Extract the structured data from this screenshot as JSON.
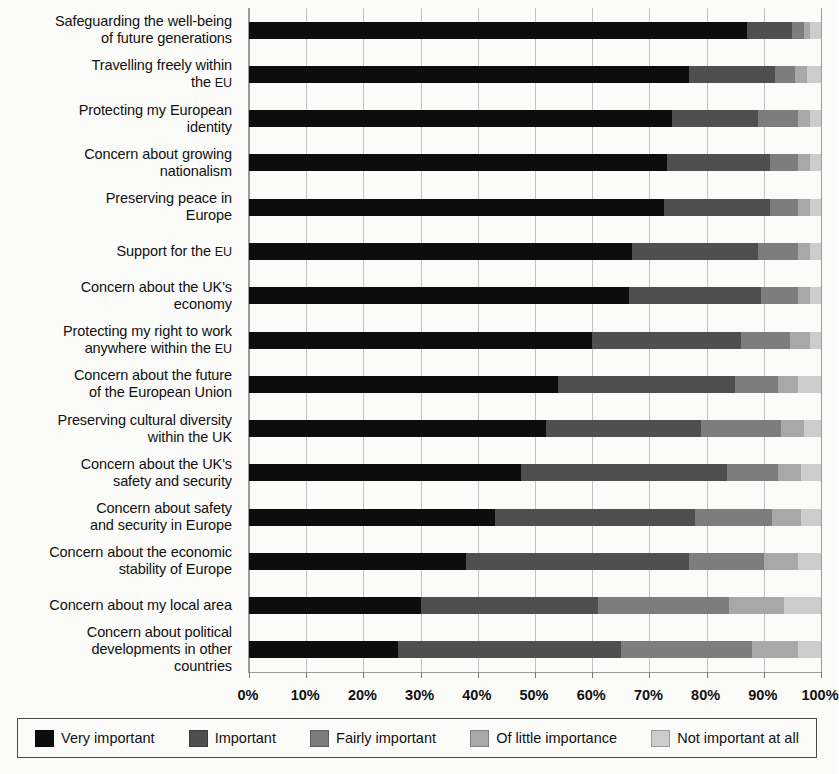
{
  "chart_data": {
    "type": "bar",
    "subtype": "horizontal-stacked-100",
    "title": "",
    "xlabel": "",
    "ylabel": "",
    "xlim": [
      0,
      100
    ],
    "xticks": [
      "0%",
      "10%",
      "20%",
      "30%",
      "40%",
      "50%",
      "60%",
      "70%",
      "80%",
      "90%",
      "100%"
    ],
    "xtick_values": [
      0,
      10,
      20,
      30,
      40,
      50,
      60,
      70,
      80,
      90,
      100
    ],
    "grid": true,
    "legend_position": "bottom",
    "categories": [
      "Safeguarding the well-being of future generations",
      "Travelling freely within the EU",
      "Protecting my European identity",
      "Concern about growing nationalism",
      "Preserving peace in Europe",
      "Support for the EU",
      "Concern about the UK's economy",
      "Protecting my right to work anywhere within the EU",
      "Concern about the future of the European Union",
      "Preserving cultural diversity within the UK",
      "Concern about the UK's safety and security",
      "Concern about safety and security in Europe",
      "Concern about the economic stability of Europe",
      "Concern about my local area",
      "Concern about political developments in other countries"
    ],
    "series": [
      {
        "name": "Very important",
        "color": "#0d0d0d",
        "values": [
          87,
          77,
          74,
          73,
          72.5,
          67,
          66.5,
          60,
          54,
          52,
          47.5,
          43,
          38,
          30,
          26
        ]
      },
      {
        "name": "Important",
        "color": "#4f4f4f",
        "values": [
          8,
          15,
          15,
          18,
          18.5,
          22,
          23,
          26,
          31,
          27,
          36,
          35,
          39,
          31,
          39
        ]
      },
      {
        "name": "Fairly important",
        "color": "#7d7d7d",
        "values": [
          2,
          3.5,
          7,
          5,
          5,
          7,
          6.5,
          8.5,
          7.5,
          14,
          9,
          13.5,
          13,
          23,
          23
        ]
      },
      {
        "name": "Of little importance",
        "color": "#a8a8a8",
        "values": [
          1,
          2,
          2,
          2,
          2,
          2,
          2,
          3.5,
          3.5,
          4,
          4,
          5,
          6,
          9.5,
          8
        ]
      },
      {
        "name": "Not important at all",
        "color": "#cccccc",
        "values": [
          2,
          2.5,
          2,
          2,
          2,
          2,
          2,
          2,
          4,
          3,
          3.5,
          3.5,
          4,
          6.5,
          4
        ]
      }
    ]
  },
  "y_labels": [
    {
      "lines": [
        "Safeguarding the well-being",
        "of future generations"
      ]
    },
    {
      "lines": [
        "Travelling freely within",
        "the EU"
      ]
    },
    {
      "lines": [
        "Protecting my European",
        "identity"
      ]
    },
    {
      "lines": [
        "Concern about growing",
        "nationalism"
      ]
    },
    {
      "lines": [
        "Preserving peace in",
        "Europe"
      ]
    },
    {
      "lines": [
        "Support for the EU"
      ]
    },
    {
      "lines": [
        "Concern about the UK's",
        "economy"
      ]
    },
    {
      "lines": [
        "Protecting my right to work",
        "anywhere within the EU"
      ]
    },
    {
      "lines": [
        "Concern about the future",
        "of the European Union"
      ]
    },
    {
      "lines": [
        "Preserving cultural diversity",
        "within the UK"
      ]
    },
    {
      "lines": [
        "Concern about the UK's",
        "safety and security"
      ]
    },
    {
      "lines": [
        "Concern about safety",
        "and security in Europe"
      ]
    },
    {
      "lines": [
        "Concern about the economic",
        "stability of Europe"
      ]
    },
    {
      "lines": [
        "Concern about my local area"
      ]
    },
    {
      "lines": [
        "Concern about political",
        "developments in other",
        "countries"
      ]
    }
  ],
  "legend": {
    "items": [
      {
        "label": "Very important",
        "color": "#0d0d0d"
      },
      {
        "label": "Important",
        "color": "#4f4f4f"
      },
      {
        "label": "Fairly important",
        "color": "#7d7d7d"
      },
      {
        "label": "Of little importance",
        "color": "#a8a8a8"
      },
      {
        "label": "Not important at all",
        "color": "#cccccc"
      }
    ]
  }
}
